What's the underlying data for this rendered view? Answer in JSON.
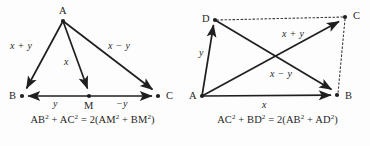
{
  "figure": {
    "background_color": "#fdfdfd",
    "ink_color": "#1f1f1f",
    "panels": [
      {
        "id": "median-triangle",
        "caption_parts": {
          "lhs_a_base": "AB",
          "lhs_a_exp": "2",
          "plus": "+",
          "lhs_b_base": "AC",
          "lhs_b_exp": "2",
          "equals": "=",
          "factor": "2(",
          "rhs_a_base": "AM",
          "rhs_a_exp": "2",
          "rhs_plus": "+",
          "rhs_b_base": "BM",
          "rhs_b_exp": "2",
          "close": ")"
        },
        "caption_text": "AB² + AC² = 2(AM² + BM²)",
        "vertices": [
          {
            "name": "A",
            "label": "A",
            "x": 63,
            "y": 21
          },
          {
            "name": "B",
            "label": "B",
            "x": 22,
            "y": 96
          },
          {
            "name": "M",
            "label": "M",
            "x": 89,
            "y": 96
          },
          {
            "name": "C",
            "label": "C",
            "x": 158,
            "y": 96
          }
        ],
        "edges": [
          {
            "name": "A-to-B",
            "from": "A",
            "to": "B",
            "style": "solid",
            "arrow": "end",
            "label": "x + y"
          },
          {
            "name": "A-to-M",
            "from": "A",
            "to": "M",
            "style": "solid",
            "arrow": "end",
            "label": "x"
          },
          {
            "name": "A-to-C",
            "from": "A",
            "to": "C",
            "style": "solid",
            "arrow": "end",
            "label": "x − y"
          },
          {
            "name": "M-to-B",
            "from": "M",
            "to": "B",
            "style": "solid",
            "arrow": "end",
            "label": "y"
          },
          {
            "name": "M-to-C",
            "from": "M",
            "to": "C",
            "style": "solid",
            "arrow": "end",
            "label": "−y"
          }
        ],
        "edge_labels": [
          {
            "name": "label-x-plus-y",
            "text": "x + y",
            "x": 10,
            "y": 46
          },
          {
            "name": "label-x",
            "text": "x",
            "x": 65,
            "y": 62
          },
          {
            "name": "label-x-minus-y",
            "text": "x − y",
            "x": 112,
            "y": 46
          },
          {
            "name": "label-y",
            "text": "y",
            "x": 53,
            "y": 102
          },
          {
            "name": "label-minus-y",
            "text": "−y",
            "x": 118,
            "y": 102
          }
        ]
      },
      {
        "id": "parallelogram",
        "caption_parts": {
          "lhs_a_base": "AC",
          "lhs_a_exp": "2",
          "plus": "+",
          "lhs_b_base": "BD",
          "lhs_b_exp": "2",
          "equals": "=",
          "factor": "2(",
          "rhs_a_base": "AB",
          "rhs_a_exp": "2",
          "rhs_plus": "+",
          "rhs_b_base": "AD",
          "rhs_b_exp": "2",
          "close": ")"
        },
        "caption_text": "AC² + BD² = 2(AB² + AD²)",
        "vertices": [
          {
            "name": "D",
            "label": "D",
            "x": 30,
            "y": 20
          },
          {
            "name": "C",
            "label": "C",
            "x": 160,
            "y": 17
          },
          {
            "name": "A",
            "label": "A",
            "x": 17,
            "y": 96
          },
          {
            "name": "B",
            "label": "B",
            "x": 152,
            "y": 95
          }
        ],
        "edges": [
          {
            "name": "A-to-D",
            "from": "A",
            "to": "D",
            "style": "solid",
            "arrow": "end",
            "label": "y"
          },
          {
            "name": "A-to-B",
            "from": "A",
            "to": "B",
            "style": "solid",
            "arrow": "end",
            "label": "x"
          },
          {
            "name": "A-to-C",
            "from": "A",
            "to": "C",
            "style": "solid",
            "arrow": "end",
            "label": "x + y"
          },
          {
            "name": "D-to-B",
            "from": "D",
            "to": "B",
            "style": "solid",
            "arrow": "end",
            "label": "x − y"
          },
          {
            "name": "D-to-C",
            "from": "D",
            "to": "C",
            "style": "dotted",
            "arrow": "none",
            "label": ""
          },
          {
            "name": "C-to-B",
            "from": "C",
            "to": "B",
            "style": "dotted",
            "arrow": "none",
            "label": ""
          }
        ],
        "edge_labels": [
          {
            "name": "label-y",
            "text": "y",
            "x": 16,
            "y": 52
          },
          {
            "name": "label-x-plus-y",
            "text": "x + y",
            "x": 100,
            "y": 33
          },
          {
            "name": "label-x-minus-y",
            "text": "x − y",
            "x": 88,
            "y": 73
          },
          {
            "name": "label-x",
            "text": "x",
            "x": 78,
            "y": 103
          }
        ]
      }
    ]
  }
}
